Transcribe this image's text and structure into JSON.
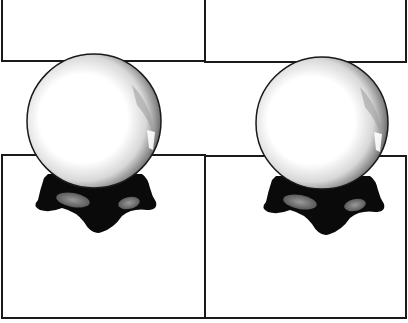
{
  "scene": {
    "description": "Two crystal balls on black stands overlapping a 2x2 grid of empty panels",
    "background": "#ffffff",
    "line_color": "#1a1a1a",
    "panels": [
      {
        "id": "top-left",
        "x": 1,
        "y": -2,
        "w": 205,
        "h": 64
      },
      {
        "id": "top-right",
        "x": 204,
        "y": -2,
        "w": 203,
        "h": 65
      },
      {
        "id": "bottom-left",
        "x": 1,
        "y": 154,
        "w": 205,
        "h": 165
      },
      {
        "id": "bottom-right",
        "x": 204,
        "y": 155,
        "w": 203,
        "h": 164
      }
    ],
    "crystal_balls": [
      {
        "id": "left-ball",
        "cx": 94,
        "cy": 121,
        "r": 67
      },
      {
        "id": "right-ball",
        "cx": 322,
        "cy": 123,
        "r": 66
      }
    ]
  }
}
